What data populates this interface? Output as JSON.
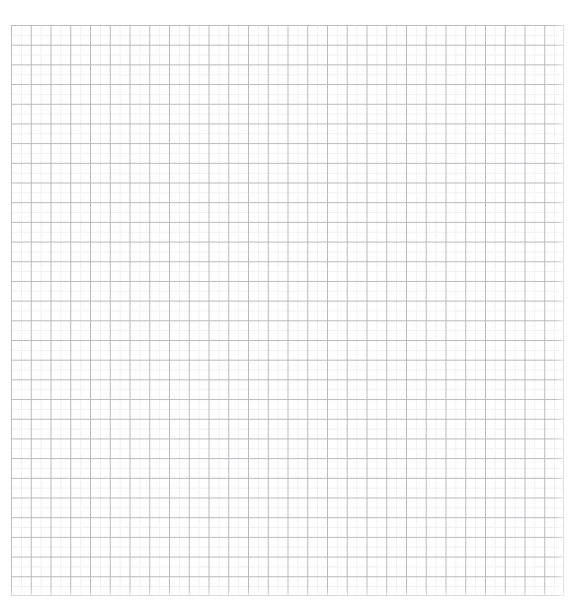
{
  "page": {
    "background_color": "#ffffff",
    "width": 576,
    "height": 612
  },
  "top_caption": {
    "text": "",
    "color": "#f2f2f4",
    "note": "clipped caption fragment, illegible"
  },
  "grid": {
    "label": "Graph paper grid",
    "columns": 28,
    "rows": 29,
    "cell_width_px": 19.75,
    "cell_height_px": 19.69,
    "origin_x_px": 11,
    "origin_y_px": 25,
    "width_px": 553,
    "height_px": 571,
    "major_line_color": "#b9b9be",
    "minor_line_color": "#f0f0f3",
    "background_color": "#ffffff",
    "border_color": "#bcbcc1"
  }
}
